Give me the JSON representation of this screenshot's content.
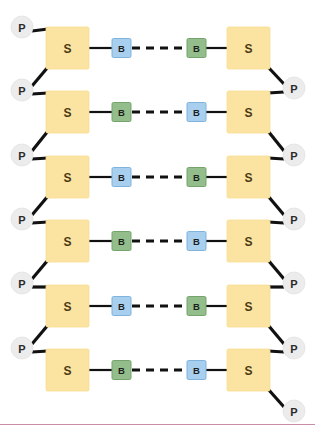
{
  "diagram": {
    "background_color": "#ffffff",
    "width": 315,
    "height": 430,
    "labels": {
      "phosphate": "P",
      "sugar": "S",
      "base": "B"
    },
    "colors": {
      "phosphate_fill": "#ececed",
      "phosphate_stroke": "#e2e2e3",
      "sugar_fill": "#fbe3a2",
      "sugar_stroke": "#f8dd93",
      "base_blue_fill": "#a9cfee",
      "base_blue_stroke": "#7fb2dd",
      "base_green_fill": "#93bd8a",
      "base_green_stroke": "#74a46c",
      "line": "#111111",
      "bottom_rule": "#c98ca8"
    },
    "geometry": {
      "sugar_width": 43,
      "sugar_height": 42,
      "base_size": 19,
      "phosphate_radius": 11,
      "left_sugar_x": 46,
      "right_sugar_x": 227,
      "left_base_x": 112,
      "right_base_x": 187,
      "left_phosphate_cx": 22,
      "right_phosphate_cx": 294,
      "bottom_rule_y": 424
    },
    "rows": [
      {
        "index": 1,
        "center_y": 48,
        "left_sugar_label": "S",
        "right_sugar_label": "S",
        "left_base_label": "B",
        "right_base_label": "B",
        "left_base_color": "blue",
        "right_base_color": "green"
      },
      {
        "index": 2,
        "center_y": 112,
        "left_sugar_label": "S",
        "right_sugar_label": "S",
        "left_base_label": "B",
        "right_base_label": "B",
        "left_base_color": "green",
        "right_base_color": "blue"
      },
      {
        "index": 3,
        "center_y": 177,
        "left_sugar_label": "S",
        "right_sugar_label": "S",
        "left_base_label": "B",
        "right_base_label": "B",
        "left_base_color": "blue",
        "right_base_color": "green"
      },
      {
        "index": 4,
        "center_y": 241,
        "left_sugar_label": "S",
        "right_sugar_label": "S",
        "left_base_label": "B",
        "right_base_label": "B",
        "left_base_color": "green",
        "right_base_color": "blue"
      },
      {
        "index": 5,
        "center_y": 306,
        "left_sugar_label": "S",
        "right_sugar_label": "S",
        "left_base_label": "B",
        "right_base_label": "B",
        "left_base_color": "blue",
        "right_base_color": "green"
      },
      {
        "index": 6,
        "center_y": 370,
        "left_sugar_label": "S",
        "right_sugar_label": "S",
        "left_base_label": "B",
        "right_base_label": "B",
        "left_base_color": "green",
        "right_base_color": "blue"
      }
    ],
    "left_phosphates": [
      {
        "label": "P",
        "cx": 22,
        "cy": 27
      },
      {
        "label": "P",
        "cx": 22,
        "cy": 90
      },
      {
        "label": "P",
        "cx": 22,
        "cy": 155
      },
      {
        "label": "P",
        "cx": 22,
        "cy": 219
      },
      {
        "label": "P",
        "cx": 22,
        "cy": 283
      },
      {
        "label": "P",
        "cx": 22,
        "cy": 348
      }
    ],
    "right_phosphates": [
      {
        "label": "P",
        "cx": 294,
        "cy": 88
      },
      {
        "label": "P",
        "cx": 294,
        "cy": 155
      },
      {
        "label": "P",
        "cx": 294,
        "cy": 219
      },
      {
        "label": "P",
        "cx": 294,
        "cy": 283
      },
      {
        "label": "P",
        "cx": 294,
        "cy": 348
      },
      {
        "label": "P",
        "cx": 294,
        "cy": 411
      }
    ]
  }
}
